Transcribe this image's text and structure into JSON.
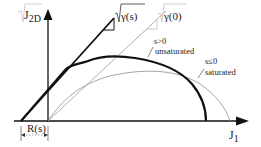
{
  "diagram": {
    "type": "yield surface schematic",
    "axes": {
      "y_label_main": "J",
      "y_label_sub": "2D",
      "y_label_prefix": "√",
      "x_label_main": "J",
      "x_label_sub": "1"
    },
    "lines": {
      "thick_slope_label": "√γ(s)",
      "thin_slope_label": "√γ(0)"
    },
    "curves": {
      "unsaturated": {
        "condition": "s>0",
        "label": "unsaturated"
      },
      "saturated": {
        "condition": "s≤0",
        "label": "saturated"
      }
    },
    "offset_label": "R(s)",
    "colors": {
      "thick": "#111111",
      "thin": "#9a9a9a",
      "axis": "#111111"
    }
  }
}
